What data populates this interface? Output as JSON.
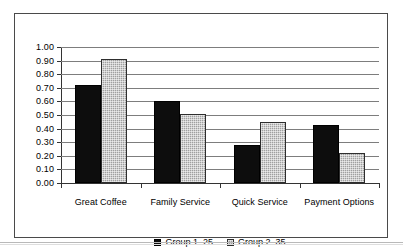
{
  "chart_data": {
    "type": "bar",
    "title": "",
    "subtitle": "",
    "xlabel": "",
    "ylabel": "",
    "categories": [
      "Great Coffee",
      "Family Service",
      "Quick Service",
      "Payment Options"
    ],
    "series": [
      {
        "name": "Group 1–25",
        "values": [
          0.72,
          0.6,
          0.28,
          0.43
        ],
        "color": "#0d0d0d"
      },
      {
        "name": "Group 2–35",
        "values": [
          0.91,
          0.51,
          0.45,
          0.22
        ],
        "color": "#a0a0a0"
      }
    ],
    "ylim": [
      0.0,
      1.0
    ],
    "ytick_step": 0.1,
    "ytick_labels": [
      "0.00",
      "0.10",
      "0.20",
      "0.30",
      "0.40",
      "0.50",
      "0.60",
      "0.70",
      "0.80",
      "0.90",
      "1.00"
    ],
    "grid": true,
    "grid_axis": "y",
    "legend_position": "bottom"
  },
  "legend": {
    "items": [
      {
        "label": "Group 1–25"
      },
      {
        "label": "Group 2–35"
      }
    ]
  }
}
